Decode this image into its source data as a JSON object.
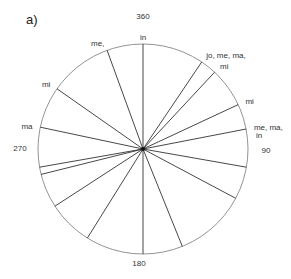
{
  "panel_label": "a)",
  "geometry": {
    "cx": 143,
    "cy": 149,
    "r": 105
  },
  "colors": {
    "stroke": "#333333",
    "circle": "#777777",
    "text": "#333333"
  },
  "axis_labels": {
    "north": "360",
    "east": "90",
    "south": "180",
    "west": "270"
  },
  "rays": [
    {
      "angle": 0,
      "label": "in"
    },
    {
      "angle": 34,
      "label": "jo, me, ma,"
    },
    {
      "angle": 43,
      "label": "mi"
    },
    {
      "angle": 65,
      "label": "mi"
    },
    {
      "angle": 79,
      "label": "me, ma,",
      "label2": "in"
    },
    {
      "angle": 100,
      "label": ""
    },
    {
      "angle": 118,
      "label": ""
    },
    {
      "angle": 158,
      "label": ""
    },
    {
      "angle": 180,
      "label": ""
    },
    {
      "angle": 212,
      "label": ""
    },
    {
      "angle": 237,
      "label": ""
    },
    {
      "angle": 256,
      "label": ""
    },
    {
      "angle": 260,
      "label": ""
    },
    {
      "angle": 282,
      "label": "ma"
    },
    {
      "angle": 305,
      "label": "mi"
    },
    {
      "angle": 340,
      "label": "me,"
    }
  ]
}
